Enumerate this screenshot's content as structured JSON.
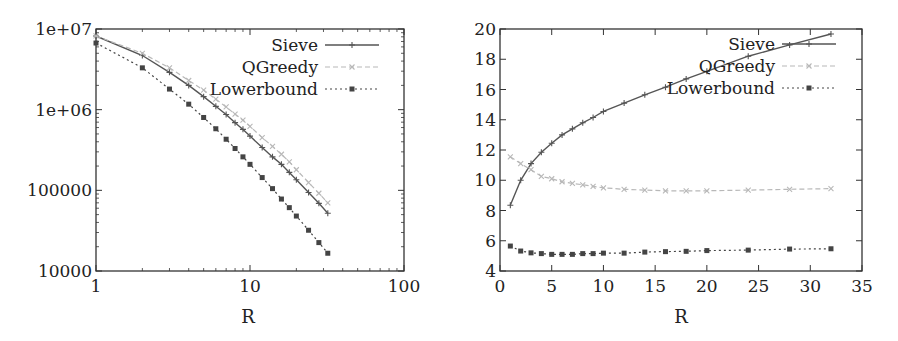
{
  "chart_data": [
    {
      "type": "line",
      "title": "",
      "xlabel": "R",
      "ylabel": "",
      "xscale": "log",
      "yscale": "log",
      "xlim": [
        1,
        100
      ],
      "ylim": [
        10000,
        10000000
      ],
      "xticks": [
        1,
        10,
        100
      ],
      "xtick_labels": [
        "1",
        "10",
        "100"
      ],
      "yticks": [
        10000,
        100000,
        1000000,
        10000000
      ],
      "ytick_labels": [
        "10000",
        "100000",
        "1e+06",
        "1e+07"
      ],
      "grid": false,
      "legend_position": "upper right",
      "x": [
        1,
        2,
        3,
        4,
        5,
        6,
        7,
        8,
        9,
        10,
        12,
        14,
        16,
        18,
        20,
        24,
        28,
        32
      ],
      "series": [
        {
          "name": "Sieve",
          "style": "solid",
          "marker": "plus",
          "values": [
            8200000,
            4700000,
            2900000,
            2000000,
            1450000,
            1100000,
            870000,
            690000,
            570000,
            470000,
            340000,
            260000,
            210000,
            167000,
            135000,
            94000,
            69000,
            52000
          ]
        },
        {
          "name": "QGreedy",
          "style": "dashed",
          "marker": "cross",
          "values": [
            8200000,
            5000000,
            3300000,
            2300000,
            1750000,
            1350000,
            1080000,
            880000,
            740000,
            620000,
            450000,
            350000,
            280000,
            225000,
            180000,
            125000,
            92000,
            70000
          ]
        },
        {
          "name": "Lowerbound",
          "style": "dotted",
          "marker": "square",
          "values": [
            6700000,
            3300000,
            1800000,
            1170000,
            800000,
            580000,
            430000,
            330000,
            260000,
            210000,
            144000,
            105000,
            78000,
            61000,
            48000,
            32000,
            22500,
            16600
          ]
        }
      ]
    },
    {
      "type": "line",
      "title": "",
      "xlabel": "R",
      "ylabel": "",
      "xscale": "linear",
      "yscale": "linear",
      "xlim": [
        0,
        35
      ],
      "ylim": [
        4,
        20
      ],
      "xticks": [
        0,
        5,
        10,
        15,
        20,
        25,
        30,
        35
      ],
      "xtick_labels": [
        "0",
        "5",
        "10",
        "15",
        "20",
        "25",
        "30",
        "35"
      ],
      "yticks": [
        4,
        6,
        8,
        10,
        12,
        14,
        16,
        18,
        20
      ],
      "ytick_labels": [
        "4",
        "6",
        "8",
        "10",
        "12",
        "14",
        "16",
        "18",
        "20"
      ],
      "grid": false,
      "legend_position": "upper right",
      "x": [
        1,
        2,
        3,
        4,
        5,
        6,
        7,
        8,
        9,
        10,
        12,
        14,
        16,
        18,
        20,
        24,
        28,
        32
      ],
      "series": [
        {
          "name": "Sieve",
          "style": "solid",
          "marker": "plus",
          "values": [
            8.35,
            10.0,
            11.1,
            11.85,
            12.45,
            13.0,
            13.4,
            13.8,
            14.15,
            14.55,
            15.1,
            15.65,
            16.15,
            16.7,
            17.2,
            18.2,
            18.95,
            19.67
          ]
        },
        {
          "name": "QGreedy",
          "style": "dashed",
          "marker": "cross",
          "values": [
            11.55,
            11.1,
            10.7,
            10.25,
            10.1,
            9.9,
            9.8,
            9.7,
            9.6,
            9.5,
            9.4,
            9.35,
            9.3,
            9.3,
            9.3,
            9.35,
            9.4,
            9.45
          ]
        },
        {
          "name": "Lowerbound",
          "style": "dotted",
          "marker": "square",
          "values": [
            5.65,
            5.32,
            5.2,
            5.15,
            5.1,
            5.1,
            5.1,
            5.15,
            5.15,
            5.18,
            5.18,
            5.25,
            5.28,
            5.3,
            5.35,
            5.38,
            5.45,
            5.47
          ]
        }
      ]
    }
  ],
  "styles": {
    "Sieve": {
      "color": "#555555",
      "width": 1.4,
      "dash": ""
    },
    "QGreedy": {
      "color": "#b8b8b8",
      "width": 1.2,
      "dash": "5,3"
    },
    "Lowerbound": {
      "color": "#444444",
      "width": 1.2,
      "dash": "2,3"
    },
    "frame_color": "#333333"
  }
}
